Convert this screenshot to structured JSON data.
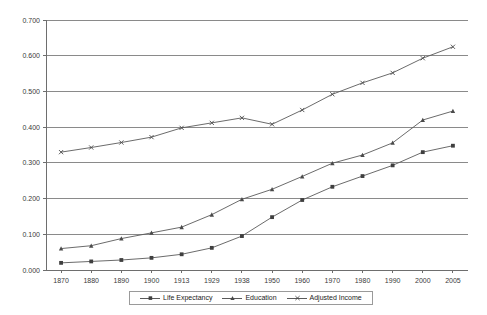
{
  "chart_data": {
    "type": "line",
    "title": "",
    "xlabel": "",
    "ylabel": "",
    "categories": [
      "1870",
      "1880",
      "1890",
      "1900",
      "1913",
      "1929",
      "1938",
      "1950",
      "1960",
      "1970",
      "1980",
      "1990",
      "2000",
      "2005"
    ],
    "ylim": [
      0.0,
      0.7
    ],
    "ytick_labels": [
      "0.000",
      "0.100",
      "0.200",
      "0.300",
      "0.400",
      "0.500",
      "0.600",
      "0.700"
    ],
    "ytick_values": [
      0.0,
      0.1,
      0.2,
      0.3,
      0.4,
      0.5,
      0.6,
      0.7
    ],
    "grid": true,
    "legend_position": "bottom",
    "series": [
      {
        "name": "Life Expectancy",
        "marker": "square",
        "values": [
          0.02,
          0.024,
          0.028,
          0.034,
          0.044,
          0.062,
          0.095,
          0.148,
          0.196,
          0.233,
          0.263,
          0.293,
          0.33,
          0.348
        ]
      },
      {
        "name": "Education",
        "marker": "triangle",
        "values": [
          0.06,
          0.068,
          0.088,
          0.104,
          0.12,
          0.155,
          0.198,
          0.226,
          0.262,
          0.299,
          0.322,
          0.356,
          0.42,
          0.445
        ]
      },
      {
        "name": "Adjusted Income",
        "marker": "x",
        "values": [
          0.33,
          0.343,
          0.357,
          0.372,
          0.398,
          0.412,
          0.426,
          0.408,
          0.448,
          0.492,
          0.524,
          0.552,
          0.593,
          0.625
        ]
      }
    ]
  },
  "legend": {
    "entries": [
      {
        "label": "Life Expectancy"
      },
      {
        "label": "Education"
      },
      {
        "label": "Adjusted Income"
      }
    ]
  }
}
